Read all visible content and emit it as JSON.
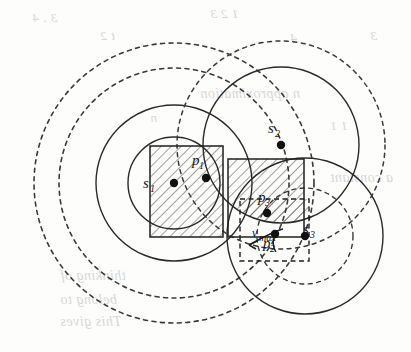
{
  "figure": {
    "kind": "geometric-diagram",
    "background_color": "#fdfdfc",
    "stroke_color": "#262626",
    "hatch_color": "#555555",
    "ghost_text_color": "#b9b8b4"
  },
  "labels": {
    "s1": {
      "base": "s",
      "sub": "1"
    },
    "s2": {
      "base": "s",
      "sub": "2"
    },
    "s3": {
      "base": "s",
      "sub": "3"
    },
    "p1": {
      "base": "p",
      "sub": "1"
    },
    "p2": {
      "base": "p",
      "sub": "2"
    },
    "p3": {
      "base": "p",
      "sub": "3"
    },
    "vmax": {
      "base": "v",
      "sub": "max"
    }
  },
  "points": [
    {
      "id": "s1",
      "x": 174,
      "y": 183,
      "label": "s",
      "sub": "1",
      "label_dx": -22,
      "label_dy": 5
    },
    {
      "id": "s2",
      "x": 281,
      "y": 145,
      "label": "s",
      "sub": "2",
      "label_dx": -4,
      "label_dy": -12
    },
    {
      "id": "s3",
      "x": 305,
      "y": 236,
      "label": "s",
      "sub": "3",
      "label_dx": 7,
      "label_dy": -2
    },
    {
      "id": "p1",
      "x": 206,
      "y": 178,
      "label": "p",
      "sub": "1",
      "label_dx": -5,
      "label_dy": -13
    },
    {
      "id": "p2",
      "x": 275,
      "y": 234,
      "label": "p",
      "sub": "2",
      "label_dx": -3,
      "label_dy": 14
    },
    {
      "id": "p3",
      "x": 267,
      "y": 213,
      "label": "p",
      "sub": "3",
      "label_dx": 0,
      "label_dy": -11
    }
  ],
  "circles": [
    {
      "id": "s1-outer-dashed-2",
      "cx": 174,
      "cy": 183,
      "r": 140,
      "style": "dashed"
    },
    {
      "id": "s1-outer-dashed-1",
      "cx": 174,
      "cy": 183,
      "r": 115,
      "style": "dashed"
    },
    {
      "id": "s1-outer-solid",
      "cx": 174,
      "cy": 183,
      "r": 78,
      "style": "solid"
    },
    {
      "id": "s1-inner-solid",
      "cx": 174,
      "cy": 183,
      "r": 46,
      "style": "solid"
    },
    {
      "id": "s2-solid",
      "cx": 281,
      "cy": 145,
      "r": 78,
      "style": "solid"
    },
    {
      "id": "s2-dashed-outer",
      "cx": 281,
      "cy": 145,
      "r": 104,
      "style": "dashed"
    },
    {
      "id": "s3-solid",
      "cx": 305,
      "cy": 236,
      "r": 78,
      "style": "solid"
    },
    {
      "id": "s3-dashed-inner",
      "cx": 305,
      "cy": 236,
      "r": 48,
      "style": "dashed"
    }
  ],
  "rectangles": [
    {
      "id": "rect-left-solid",
      "x": 150,
      "y": 146,
      "w": 73,
      "h": 91,
      "style": "solid"
    },
    {
      "id": "rect-right-solid",
      "x": 228,
      "y": 159,
      "w": 76,
      "h": 78,
      "style": "solid"
    },
    {
      "id": "rect-dashed",
      "x": 240,
      "y": 199,
      "w": 69,
      "h": 62,
      "style": "dashed"
    }
  ],
  "hatched_regions": [
    {
      "id": "hatch-left",
      "note": "intersection of left rectangle with s1 disk"
    },
    {
      "id": "hatch-right",
      "note": "intersection of right rectangle with s2 disk"
    },
    {
      "id": "hatch-small",
      "note": "small intersection near p3"
    }
  ],
  "arrow": {
    "id": "vmax-arrow",
    "label": "v",
    "sub": "max",
    "from_x": 283,
    "from_y": 229,
    "to_x": 246,
    "to_y": 246
  },
  "ghost_text_lines": [
    {
      "text": "3 . 4",
      "x": 32,
      "y": 10,
      "size": 13
    },
    {
      "text": "1  2  3",
      "x": 210,
      "y": 6,
      "size": 13
    },
    {
      "text": "3",
      "x": 370,
      "y": 28,
      "size": 13
    },
    {
      "text": "4",
      "x": 290,
      "y": 30,
      "size": 13
    },
    {
      "text": "t  2",
      "x": 100,
      "y": 28,
      "size": 13
    },
    {
      "text": "n approximation",
      "x": 200,
      "y": 86,
      "size": 14
    },
    {
      "text": "n",
      "x": 150,
      "y": 110,
      "size": 13
    },
    {
      "text": "1  1",
      "x": 330,
      "y": 118,
      "size": 13
    },
    {
      "text": "a constant",
      "x": 330,
      "y": 170,
      "size": 14
    },
    {
      "text": "thinking of",
      "x": 60,
      "y": 268,
      "size": 14
    },
    {
      "text": "belong to",
      "x": 60,
      "y": 292,
      "size": 14
    },
    {
      "text": "This gives",
      "x": 60,
      "y": 314,
      "size": 14
    }
  ]
}
